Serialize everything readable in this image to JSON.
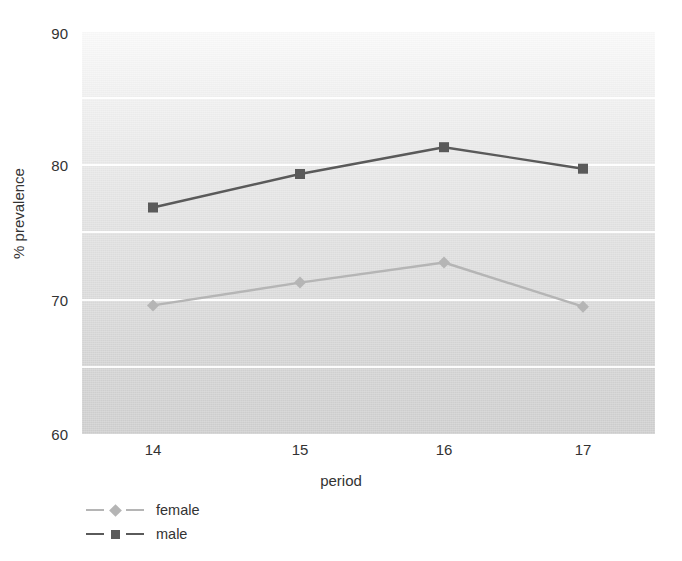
{
  "chart_data": {
    "type": "line",
    "title": "",
    "xlabel": "period",
    "ylabel": "% prevalence",
    "categories": [
      "14",
      "15",
      "16",
      "17"
    ],
    "x": [
      14,
      15,
      16,
      17
    ],
    "xlim": [
      13.6,
      17.5
    ],
    "ylim": [
      60,
      90
    ],
    "yticks": [
      60,
      70,
      80,
      90
    ],
    "ytick_labels": [
      "60",
      "70",
      "80",
      "90"
    ],
    "xtick_labels": [
      "14",
      "15",
      "16",
      "17"
    ],
    "grid": true,
    "grid_values": [
      65,
      70,
      75,
      80,
      85
    ],
    "legend_position": "below-left",
    "series": [
      {
        "name": "female",
        "marker": "diamond",
        "color": "#b5b5b5",
        "values": [
          69.6,
          71.3,
          72.8,
          69.5
        ]
      },
      {
        "name": "male",
        "marker": "square",
        "color": "#5a5a5a",
        "values": [
          76.9,
          79.4,
          81.4,
          79.8
        ]
      }
    ]
  },
  "axes": {
    "y_label": "% prevalence",
    "x_label": "period",
    "y_ticks": [
      "90",
      "80",
      "70",
      "60"
    ],
    "x_ticks": [
      "14",
      "15",
      "16",
      "17"
    ]
  },
  "legend": {
    "items": [
      {
        "label": "female",
        "marker": "diamond-marker",
        "color": "#b5b5b5"
      },
      {
        "label": "male",
        "marker": "square-marker",
        "color": "#5a5a5a"
      }
    ]
  },
  "colors": {
    "female_series": "#b5b5b5",
    "male_series": "#5a5a5a",
    "gridline": "#ffffff",
    "plot_background_top": "#fafafa",
    "plot_background_bottom": "#cfcfcf",
    "text": "#333333"
  }
}
